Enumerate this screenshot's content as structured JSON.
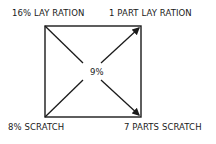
{
  "diagram": {
    "type": "pearson-square",
    "labels": {
      "top_left": "16% LAY RATION",
      "top_right": "1 PART LAY RATION",
      "bottom_left": "8% SCRATCH",
      "bottom_right": "7 PARTS SCRATCH",
      "center": "9%"
    }
  }
}
